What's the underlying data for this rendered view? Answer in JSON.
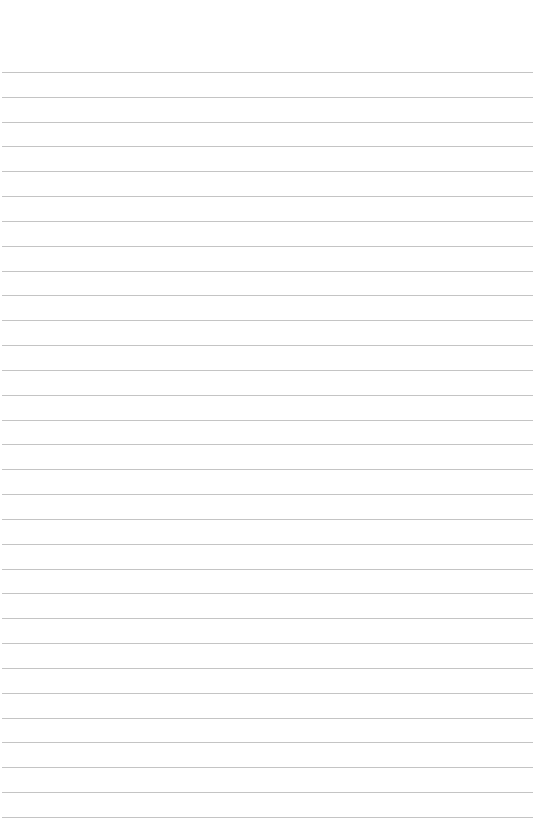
{
  "page": {
    "type": "ruled-paper",
    "background_color": "#ffffff",
    "line_color": "#c4c4c4",
    "line_count": 31,
    "first_line_y": 72,
    "line_spacing": 24.83,
    "line_left": 2,
    "line_right": 533,
    "text": ""
  }
}
